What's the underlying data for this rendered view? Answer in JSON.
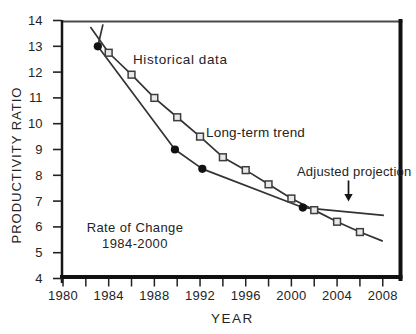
{
  "figure": {
    "xlabel": "YEAR",
    "ylabel": "PRODUCTIVITY RATIO"
  },
  "annotations": {
    "historical": "Historical data",
    "trend": "Long-term trend",
    "adjusted": "Adjusted projection",
    "rate_line1": "Rate of Change",
    "rate_line2": "1984-2000"
  },
  "chart_data": {
    "type": "line",
    "title": "",
    "xlabel": "YEAR",
    "ylabel": "PRODUCTIVITY RATIO",
    "xlim": [
      1980,
      2009
    ],
    "ylim": [
      4,
      14
    ],
    "x_major_ticks": [
      1980,
      1984,
      1988,
      1992,
      1996,
      2000,
      2004,
      2008
    ],
    "x_minor_tick_step": 2,
    "y_ticks": [
      4,
      5,
      6,
      7,
      8,
      9,
      10,
      11,
      12,
      13,
      14
    ],
    "grid": false,
    "legend": "inline-labels",
    "colors": {
      "axis": "#111111",
      "line": "#333333",
      "circle_marker": "#111111",
      "square_marker_fill": "#e8e8e8",
      "square_marker_stroke": "#3d3d3d",
      "text": "#242424"
    },
    "series": [
      {
        "name": "Historical data",
        "marker": "circle",
        "line": [
          [
            1983.5,
            13.85
          ],
          [
            1983.05,
            13.0
          ],
          [
            1989.8,
            9.0
          ],
          [
            1992.2,
            8.25
          ],
          [
            2001.0,
            6.75
          ]
        ],
        "markers": [
          [
            1983.05,
            13.0
          ],
          [
            1989.8,
            9.0
          ],
          [
            1992.2,
            8.25
          ],
          [
            2001.0,
            6.75
          ]
        ]
      },
      {
        "name": "Long-term trend",
        "marker": "square",
        "line": [
          [
            1982.4,
            13.75
          ],
          [
            1984,
            12.75
          ],
          [
            1986,
            11.9
          ],
          [
            1988,
            11.0
          ],
          [
            1990,
            10.25
          ],
          [
            1992,
            9.5
          ],
          [
            1994,
            8.7
          ],
          [
            1996,
            8.2
          ],
          [
            1998,
            7.65
          ],
          [
            2000,
            7.1
          ],
          [
            2002,
            6.65
          ],
          [
            2004,
            6.2
          ],
          [
            2006,
            5.8
          ],
          [
            2008,
            5.45
          ]
        ],
        "markers": [
          [
            1984,
            12.75
          ],
          [
            1986,
            11.9
          ],
          [
            1988,
            11.0
          ],
          [
            1990,
            10.25
          ],
          [
            1992,
            9.5
          ],
          [
            1994,
            8.7
          ],
          [
            1996,
            8.2
          ],
          [
            1998,
            7.65
          ],
          [
            2000,
            7.1
          ],
          [
            2002,
            6.65
          ],
          [
            2004,
            6.2
          ],
          [
            2006,
            5.8
          ]
        ]
      },
      {
        "name": "Adjusted projection",
        "marker": "none",
        "line": [
          [
            2001.0,
            6.75
          ],
          [
            2008.1,
            6.45
          ]
        ],
        "markers": []
      }
    ],
    "arrow": {
      "year": 2005,
      "value_from": 7.8,
      "value_to": 6.98
    }
  }
}
